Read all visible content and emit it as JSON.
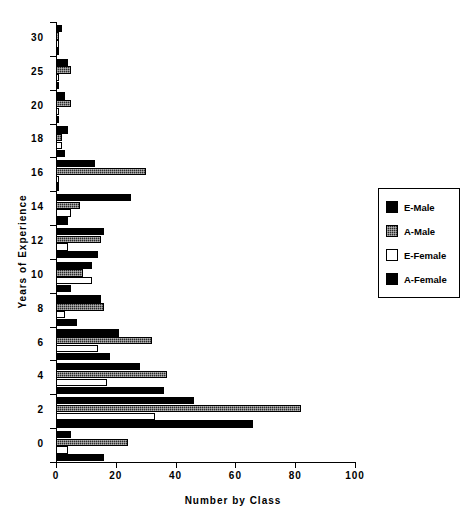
{
  "chart_data": {
    "type": "bar",
    "orientation": "horizontal",
    "title": "",
    "xlabel": "Number by Class",
    "ylabel": "Years of Experience",
    "xlim": [
      0,
      100
    ],
    "xticks": [
      0,
      20,
      40,
      60,
      80,
      100
    ],
    "xticklabels": [
      "0",
      "20",
      "40",
      "60",
      "80",
      "100"
    ],
    "yticklabels": [
      "30",
      "25",
      "20",
      "18",
      "16",
      "14",
      "12",
      "10",
      "8",
      "6",
      "4",
      "2",
      "0"
    ],
    "grid": false,
    "legend_position": "right",
    "categories": [
      "0",
      "2",
      "4",
      "6",
      "8",
      "10",
      "12",
      "14",
      "16",
      "18",
      "20",
      "25",
      "30"
    ],
    "series": [
      {
        "name": "E-Male",
        "color": "#000000",
        "fill": "solid",
        "values": [
          5,
          46,
          28,
          21,
          15,
          12,
          16,
          25,
          13,
          4,
          3,
          4,
          2
        ]
      },
      {
        "name": "A-Male",
        "color": "#2b2b2b",
        "fill": "hatched",
        "values": [
          24,
          82,
          37,
          32,
          16,
          9,
          15,
          8,
          30,
          2,
          5,
          5,
          1
        ]
      },
      {
        "name": "E-Female",
        "color": "#ffffff",
        "fill": "empty",
        "values": [
          4,
          33,
          17,
          14,
          3,
          12,
          4,
          5,
          1,
          2,
          1,
          1,
          1
        ]
      },
      {
        "name": "A-Female",
        "color": "#000000",
        "fill": "solid",
        "values": [
          16,
          66,
          36,
          18,
          7,
          5,
          14,
          4,
          1,
          3,
          1,
          1,
          1
        ]
      }
    ]
  },
  "legend": {
    "items": [
      {
        "label": "E-Male",
        "swatch": "legend-swatch-e-male"
      },
      {
        "label": "A-Male",
        "swatch": "legend-swatch-a-male"
      },
      {
        "label": "E-Female",
        "swatch": "legend-swatch-e-female"
      },
      {
        "label": "A-Female",
        "swatch": "legend-swatch-a-female"
      }
    ]
  }
}
